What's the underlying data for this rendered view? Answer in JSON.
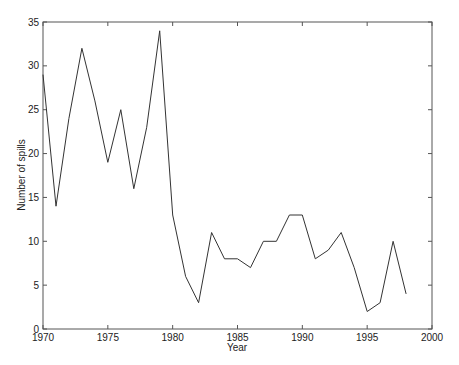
{
  "chart_data": {
    "type": "line",
    "title": "",
    "xlabel": "Year",
    "ylabel": "Number of spills",
    "xlim": [
      1970,
      2000
    ],
    "ylim": [
      0,
      35
    ],
    "xticks": [
      1970,
      1975,
      1980,
      1985,
      1990,
      1995,
      2000
    ],
    "yticks": [
      0,
      5,
      10,
      15,
      20,
      25,
      30,
      35
    ],
    "grid": false,
    "legend": null,
    "line_color": "#333333",
    "x": [
      1970,
      1971,
      1972,
      1973,
      1974,
      1975,
      1976,
      1977,
      1978,
      1979,
      1980,
      1981,
      1982,
      1983,
      1984,
      1985,
      1986,
      1987,
      1988,
      1989,
      1990,
      1991,
      1992,
      1993,
      1994,
      1995,
      1996,
      1997,
      1998
    ],
    "series": [
      {
        "name": "Number of spills",
        "values": [
          29,
          14,
          24,
          32,
          26,
          19,
          25,
          16,
          23,
          34,
          13,
          6,
          3,
          11,
          8,
          8,
          7,
          10,
          10,
          13,
          13,
          8,
          9,
          11,
          7,
          2,
          3,
          10,
          4
        ]
      }
    ]
  }
}
